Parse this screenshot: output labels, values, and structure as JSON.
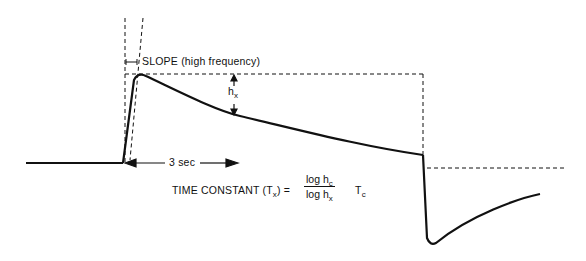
{
  "diagram": {
    "labels": {
      "slope": "SLOPE (high frequency)",
      "hx_main": "h",
      "hx_sub": "x",
      "duration": "3 sec",
      "time_constant_prefix": "TIME CONSTANT (T",
      "time_constant_sub": "x",
      "time_constant_suffix": ") =",
      "frac_num_main": "log h",
      "frac_num_sub": "c",
      "frac_den_main": "log h",
      "frac_den_sub": "x",
      "tc_main": "T",
      "tc_sub": "c"
    },
    "colors": {
      "line": "#111111",
      "background": "#ffffff"
    }
  }
}
